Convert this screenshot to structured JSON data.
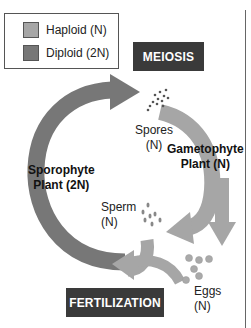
{
  "legend": {
    "items": [
      {
        "label": "Haploid (N)",
        "color": "#a6a6a6"
      },
      {
        "label": "Diploid (2N)",
        "color": "#777777"
      }
    ]
  },
  "stages": {
    "meiosis": "MEIOSIS",
    "fertilization": "FERTILIZATION"
  },
  "labels": {
    "spores": "Spores",
    "spores_ploidy": "(N)",
    "gametophyte": "Gametophyte",
    "gametophyte_ploidy": "Plant (N)",
    "sporophyte": "Sporophyte",
    "sporophyte_ploidy": "Plant (2N)",
    "sperm": "Sperm",
    "sperm_ploidy": "(N)",
    "eggs": "Eggs",
    "eggs_ploidy": "(N)"
  },
  "colors": {
    "diploid": "#777777",
    "haploid": "#a6a6a6",
    "tag_bg": "#3a3a3a"
  }
}
